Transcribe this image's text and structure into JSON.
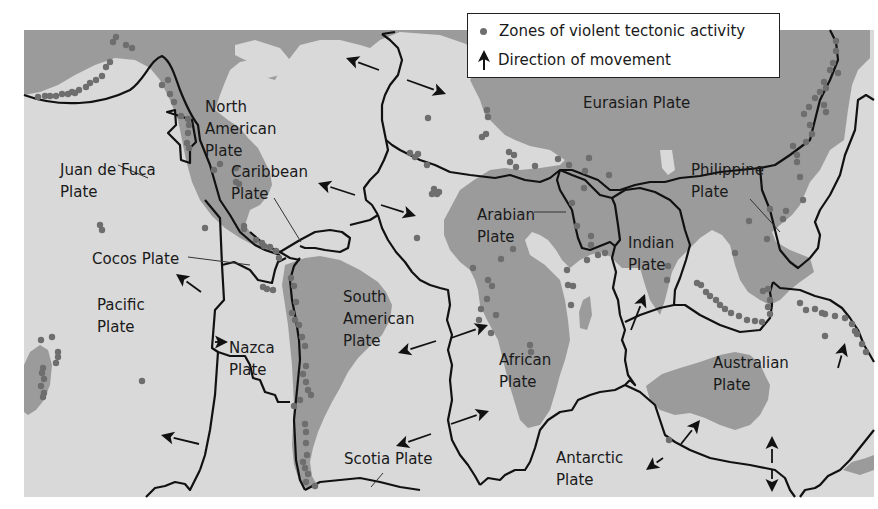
{
  "legend": {
    "dot_label": "Zones of violent tectonic activity",
    "arrow_label": "Direction of movement"
  },
  "colors": {
    "ocean": "#d9d9d9",
    "land": "#9b9b9b",
    "boundary": "#111111",
    "dot": "#6e6e6e",
    "arrow": "#111111",
    "background": "#ffffff"
  },
  "map_frame": {
    "x": 24,
    "y": 30,
    "width": 850,
    "height": 467
  },
  "plates": [
    {
      "id": "north-american",
      "lines": [
        "North",
        "American",
        "Plate"
      ],
      "x": 205,
      "y": 112
    },
    {
      "id": "eurasian",
      "lines": [
        "Eurasian Plate"
      ],
      "x": 583,
      "y": 108
    },
    {
      "id": "juan-de-fuca",
      "lines": [
        "Juan de Fuca",
        "Plate"
      ],
      "x": 60,
      "y": 175
    },
    {
      "id": "caribbean",
      "lines": [
        "Caribbean",
        "Plate"
      ],
      "x": 231,
      "y": 177
    },
    {
      "id": "philippine",
      "lines": [
        "Philippine",
        "Plate"
      ],
      "x": 691,
      "y": 175
    },
    {
      "id": "arabian",
      "lines": [
        "Arabian",
        "Plate"
      ],
      "x": 477,
      "y": 220
    },
    {
      "id": "indian",
      "lines": [
        "Indian",
        "Plate"
      ],
      "x": 628,
      "y": 248
    },
    {
      "id": "cocos",
      "lines": [
        "Cocos Plate"
      ],
      "x": 92,
      "y": 264
    },
    {
      "id": "pacific",
      "lines": [
        "Pacific",
        "Plate"
      ],
      "x": 97,
      "y": 310
    },
    {
      "id": "south-american",
      "lines": [
        "South",
        "American",
        "Plate"
      ],
      "x": 343,
      "y": 302
    },
    {
      "id": "nazca",
      "lines": [
        "Nazca",
        "Plate"
      ],
      "x": 229,
      "y": 353
    },
    {
      "id": "african",
      "lines": [
        "African",
        "Plate"
      ],
      "x": 499,
      "y": 365
    },
    {
      "id": "australian",
      "lines": [
        "Australian",
        "Plate"
      ],
      "x": 713,
      "y": 368
    },
    {
      "id": "scotia",
      "lines": [
        "Scotia Plate"
      ],
      "x": 344,
      "y": 464
    },
    {
      "id": "antarctic",
      "lines": [
        "Antarctic",
        "Plate"
      ],
      "x": 556,
      "y": 463
    }
  ],
  "leader_lines": [
    [
      [
        148,
        178
      ],
      [
        118,
        165
      ]
    ],
    [
      [
        274,
        198
      ],
      [
        301,
        242
      ]
    ],
    [
      [
        750,
        199
      ],
      [
        780,
        232
      ]
    ],
    [
      [
        534,
        212
      ],
      [
        566,
        212
      ]
    ],
    [
      [
        188,
        257
      ],
      [
        250,
        265
      ]
    ],
    [
      [
        383,
        473
      ],
      [
        371,
        487
      ]
    ]
  ],
  "arrows": [
    [
      [
        379,
        70
      ],
      [
        346,
        58
      ]
    ],
    [
      [
        407,
        80
      ],
      [
        446,
        94
      ]
    ],
    [
      [
        355,
        195
      ],
      [
        318,
        183
      ]
    ],
    [
      [
        381,
        205
      ],
      [
        416,
        216
      ]
    ],
    [
      [
        201,
        292
      ],
      [
        176,
        274
      ]
    ],
    [
      [
        222,
        342
      ],
      [
        228,
        342
      ]
    ],
    [
      [
        436,
        341
      ],
      [
        398,
        353
      ]
    ],
    [
      [
        451,
        338
      ],
      [
        488,
        325
      ]
    ],
    [
      [
        431,
        434
      ],
      [
        396,
        446
      ]
    ],
    [
      [
        451,
        424
      ],
      [
        489,
        411
      ]
    ],
    [
      [
        199,
        444
      ],
      [
        161,
        435
      ]
    ],
    [
      [
        631,
        330
      ],
      [
        645,
        294
      ]
    ],
    [
      [
        838,
        368
      ],
      [
        845,
        343
      ]
    ],
    [
      [
        681,
        444
      ],
      [
        700,
        420
      ]
    ],
    [
      [
        663,
        458
      ],
      [
        646,
        470
      ]
    ],
    [
      [
        772,
        463
      ],
      [
        772,
        436
      ]
    ],
    [
      [
        772,
        470
      ],
      [
        772,
        492
      ]
    ]
  ],
  "dots": [
    [
      116,
      37
    ],
    [
      113,
      42
    ],
    [
      126,
      45
    ],
    [
      132,
      48
    ],
    [
      110,
      62
    ],
    [
      106,
      67
    ],
    [
      102,
      76
    ],
    [
      96,
      80
    ],
    [
      90,
      83
    ],
    [
      86,
      87
    ],
    [
      79,
      90
    ],
    [
      75,
      93
    ],
    [
      72,
      92
    ],
    [
      68,
      94
    ],
    [
      62,
      94
    ],
    [
      56,
      96
    ],
    [
      50,
      96
    ],
    [
      45,
      96
    ],
    [
      38,
      97
    ],
    [
      162,
      85
    ],
    [
      168,
      80
    ],
    [
      170,
      94
    ],
    [
      174,
      102
    ],
    [
      181,
      116
    ],
    [
      188,
      119
    ],
    [
      189,
      125
    ],
    [
      188,
      133
    ],
    [
      187,
      143
    ],
    [
      189,
      148
    ],
    [
      220,
      164
    ],
    [
      214,
      170
    ],
    [
      236,
      168
    ],
    [
      236,
      182
    ],
    [
      239,
      184
    ],
    [
      205,
      228
    ],
    [
      244,
      226
    ],
    [
      244,
      229
    ],
    [
      256,
      240
    ],
    [
      262,
      243
    ],
    [
      264,
      246
    ],
    [
      270,
      247
    ],
    [
      276,
      251
    ],
    [
      279,
      258
    ],
    [
      263,
      287
    ],
    [
      267,
      289
    ],
    [
      273,
      290
    ],
    [
      291,
      278
    ],
    [
      294,
      286
    ],
    [
      296,
      302
    ],
    [
      292,
      313
    ],
    [
      295,
      320
    ],
    [
      299,
      325
    ],
    [
      302,
      337
    ],
    [
      305,
      346
    ],
    [
      300,
      400
    ],
    [
      294,
      406
    ],
    [
      306,
      366
    ],
    [
      303,
      374
    ],
    [
      306,
      382
    ],
    [
      308,
      390
    ],
    [
      311,
      395
    ],
    [
      305,
      424
    ],
    [
      306,
      432
    ],
    [
      306,
      443
    ],
    [
      307,
      455
    ],
    [
      303,
      462
    ],
    [
      305,
      468
    ],
    [
      308,
      474
    ],
    [
      306,
      482
    ],
    [
      315,
      486
    ],
    [
      41,
      340
    ],
    [
      52,
      337
    ],
    [
      58,
      352
    ],
    [
      58,
      357
    ],
    [
      56,
      363
    ],
    [
      43,
      368
    ],
    [
      42,
      373
    ],
    [
      44,
      379
    ],
    [
      41,
      386
    ],
    [
      44,
      393
    ],
    [
      43,
      397
    ],
    [
      142,
      381
    ],
    [
      100,
      225
    ],
    [
      102,
      230
    ],
    [
      428,
      118
    ],
    [
      410,
      153
    ],
    [
      418,
      154
    ],
    [
      415,
      157
    ],
    [
      427,
      165
    ],
    [
      432,
      194
    ],
    [
      437,
      194
    ],
    [
      434,
      189
    ],
    [
      439,
      192
    ],
    [
      417,
      238
    ],
    [
      487,
      110
    ],
    [
      488,
      117
    ],
    [
      486,
      134
    ],
    [
      482,
      137
    ],
    [
      509,
      152
    ],
    [
      514,
      155
    ],
    [
      510,
      162
    ],
    [
      516,
      167
    ],
    [
      535,
      166
    ],
    [
      558,
      159
    ],
    [
      569,
      165
    ],
    [
      585,
      171
    ],
    [
      589,
      158
    ],
    [
      584,
      188
    ],
    [
      609,
      175
    ],
    [
      473,
      268
    ],
    [
      488,
      280
    ],
    [
      492,
      286
    ],
    [
      487,
      299
    ],
    [
      496,
      315
    ],
    [
      481,
      309
    ],
    [
      479,
      320
    ],
    [
      491,
      333
    ],
    [
      530,
      345
    ],
    [
      531,
      352
    ],
    [
      501,
      259
    ],
    [
      513,
      249
    ],
    [
      567,
      270
    ],
    [
      571,
      305
    ],
    [
      573,
      286
    ],
    [
      568,
      285
    ],
    [
      572,
      203
    ],
    [
      577,
      226
    ],
    [
      591,
      236
    ],
    [
      591,
      245
    ],
    [
      598,
      255
    ],
    [
      587,
      260
    ],
    [
      605,
      253
    ],
    [
      668,
      266
    ],
    [
      667,
      280
    ],
    [
      735,
      253
    ],
    [
      767,
      239
    ],
    [
      749,
      221
    ],
    [
      770,
      209
    ],
    [
      786,
      211
    ],
    [
      783,
      219
    ],
    [
      803,
      200
    ],
    [
      800,
      177
    ],
    [
      797,
      162
    ],
    [
      797,
      155
    ],
    [
      793,
      146
    ],
    [
      806,
      142
    ],
    [
      812,
      134
    ],
    [
      810,
      125
    ],
    [
      804,
      114
    ],
    [
      809,
      107
    ],
    [
      815,
      98
    ],
    [
      820,
      92
    ],
    [
      826,
      88
    ],
    [
      824,
      82
    ],
    [
      830,
      70
    ],
    [
      838,
      73
    ],
    [
      833,
      63
    ],
    [
      836,
      51
    ],
    [
      836,
      41
    ],
    [
      824,
      105
    ],
    [
      826,
      112
    ],
    [
      697,
      283
    ],
    [
      701,
      285
    ],
    [
      706,
      292
    ],
    [
      710,
      296
    ],
    [
      716,
      300
    ],
    [
      720,
      305
    ],
    [
      725,
      309
    ],
    [
      731,
      313
    ],
    [
      739,
      316
    ],
    [
      747,
      320
    ],
    [
      755,
      321
    ],
    [
      762,
      322
    ],
    [
      770,
      314
    ],
    [
      768,
      307
    ],
    [
      770,
      300
    ],
    [
      763,
      291
    ],
    [
      768,
      289
    ],
    [
      800,
      303
    ],
    [
      806,
      310
    ],
    [
      815,
      309
    ],
    [
      822,
      313
    ],
    [
      825,
      314
    ],
    [
      835,
      316
    ],
    [
      845,
      318
    ],
    [
      852,
      324
    ],
    [
      857,
      334
    ],
    [
      862,
      344
    ],
    [
      866,
      352
    ],
    [
      855,
      331
    ],
    [
      825,
      336
    ],
    [
      669,
      440
    ]
  ],
  "land": [
    "M24,30 L870,30 L870,58 L858,70 L852,85 L848,110 L844,140 L830,150 L820,170 L810,182 L800,205 L792,215 L780,225 L772,232 L776,242 L790,250 L810,258 L814,272 L800,282 L790,290 L780,300 L770,305 L760,300 L748,292 L740,280 L735,265 L730,245 L722,235 L712,230 L700,238 L688,250 L678,260 L672,272 L665,300 L660,315 L650,300 L645,285 L640,268 L622,268 L611,257 L600,252 L590,255 L580,260 L570,268 L562,260 L556,250 L548,240 L540,235 L532,232 L525,240 L530,255 L545,265 L560,280 L565,300 L568,320 L570,340 L565,360 L560,375 L556,390 L550,410 L540,425 L528,428 L520,420 L514,400 L508,380 L503,360 L498,340 L487,320 L480,305 L478,290 L475,280 L470,270 L460,262 L450,250 L444,235 L444,220 L452,205 L460,190 L474,180 L490,170 L505,168 L520,170 L540,168 L560,165 L565,160 L550,150 L530,146 L515,140 L505,135 L495,125 L485,115 L480,100 L470,80 L476,70 L480,58 L466,44 L440,35 L400,32 L380,40 L370,48 L360,45 L340,40 L320,40 L300,45 L290,58 L280,70 L275,80 L268,78 L260,65 L250,60 L240,62 L230,70 L225,82 L220,95 L215,110 L228,120 L240,128 L248,138 L258,148 L264,160 L270,172 L272,185 L268,195 L260,205 L250,210 L245,225 L256,240 L270,248 L280,255 L268,252 L255,246 L240,238 L225,228 L212,216 L200,200 L192,182 L186,160 L182,140 L178,120 L170,100 L160,80 L150,68 L135,60 L115,58 L95,65 L75,75 L58,85 L40,92 L24,95 Z",
    "M285,265 L305,258 L320,256 L340,260 L360,270 L378,282 L386,292 L392,305 L390,320 L382,335 L370,346 L358,358 L348,372 L340,388 L332,402 L324,418 L318,432 L313,448 L310,462 L312,476 L318,487 L306,488 L299,480 L294,465 L292,445 L293,425 L294,405 L293,385 L292,365 L290,345 L288,325 L285,305 L282,285 Z",
    "M646,386 L662,374 L680,368 L700,362 L720,355 L735,352 L750,355 L760,364 L765,375 L770,385 L768,400 L760,415 L750,425 L735,430 L720,425 L705,418 L690,413 L675,415 L660,410 L650,400 Z",
    "M24,365 L30,352 L40,345 L48,350 L52,365 L50,385 L44,400 L36,410 L28,415 L24,412 Z",
    "M583,300 L590,296 L592,315 L587,330 L580,328 L579,312 Z",
    "M843,470 L852,462 L866,458 L874,455 L874,470 L860,475 Z"
  ],
  "ocean_islands": [
    "M235,45 L255,40 L280,48 L290,60 L280,75 L268,78 L260,68 L245,60 L235,55 Z",
    "M430,100 L448,98 L455,110 L448,120 L435,118 Z",
    "M660,150 L672,150 L675,170 L668,175 L662,168 Z",
    "M270,105 L285,105 L290,120 L278,130 L268,118 Z"
  ],
  "boundaries": [
    "M24,95 C60,108 100,105 130,90 C145,80 150,60 162,56 C172,62 176,80 180,90 C184,100 190,115 198,125 L200,140 L210,165 L220,200 L230,215 L240,232 L255,245 L265,250 L280,255",
    "M167,112 L175,110 L176,125 L168,133 L180,145 L181,160 L190,163 L190,148 L196,142 L192,120 Z",
    "M205,200 L220,218 L222,265 L234,262 L250,270 L258,280 L272,283 L275,270 L278,262 L286,258",
    "M222,265 L224,300 L215,310 L212,348 L218,352 L215,395 L210,430 L205,455 L200,470",
    "M146,497 L155,488 L165,486 L175,482 L185,484 L190,490 L200,470",
    "M218,352 L230,356 L245,356 L250,365 L253,378 L260,380 L265,392 L275,395 L278,402 L290,402",
    "M250,232 L265,245 L280,252 L290,258 L300,260",
    "M300,258 L294,266 L290,280 L292,300 L296,320 L299,340 L300,360 L298,380 L296,400 L294,420 L295,440 L296,460 L300,480 L305,490",
    "M305,490 L320,482 L340,480 L360,478 L380,482 L400,487 L420,490",
    "M280,252 L300,240 L315,232 L330,230 L342,232 L350,238 L348,248 L340,252 L325,250 L315,248 L305,248 L300,246",
    "M350,225 L370,220 L378,215",
    "M378,215 L372,205 L366,200 L364,188 L370,180 L378,172 L384,160 L388,150 L386,140 L384,130 L382,120 L382,105 L385,95 L390,85 L398,75 L402,60 L398,48 L390,40 L382,34",
    "M382,34 L395,32",
    "M378,215 L382,228 L388,240 L396,252 L405,262 L412,272 L420,280 L430,285 L440,288 L448,290 L450,305 L447,320 L452,335 L448,350 L452,365 L450,380 L452,400 L448,420 L452,440 L460,455 L468,465 L475,476 L480,485",
    "M480,485 L488,478 L500,480 L505,475 L515,470 L525,470 L530,462 L535,448 L540,430 L548,420 L560,412 L572,410 L578,400 L590,395 L600,392 L615,390 L625,385 L630,380",
    "M386,140 L392,145 L400,150 L410,155 L420,160 L435,165 L450,172 L470,175 L495,178 L510,175 L525,180 L540,182 L550,178 L560,170 L572,170 L585,175 L598,180 L610,190 L620,190 L635,185 L650,182 L665,182",
    "M560,170 L557,180 L560,190 L566,200 L572,210 L575,225 L578,238 L582,248 L590,250 L600,246 L610,242 L615,246",
    "M560,170 L572,175 L585,180 L600,195 L612,198 L615,205 L618,225 L620,240 L615,246",
    "M615,246 L612,258 L616,272 L613,288 L618,300 L620,315 L625,330 L622,340 L626,350 L625,360 L628,375 L635,385 L630,380",
    "M612,198 L625,190 L640,188 L655,192 L670,200 L680,210 L685,230 L690,245 L686,260 L680,278 L675,290 L674,305 L660,308 L640,315 L625,322",
    "M674,305 L685,305 L700,315 L720,325 L740,332 L760,330 L770,318 L772,305 L770,292 L773,282",
    "M665,182 L680,178 L700,176 L720,172 L740,170 L760,168 L775,165 L790,155 L810,140 L815,120 L820,100 L830,80 L838,60 L836,42 L830,30",
    "M760,168 L762,190 L770,210 L775,230 L780,250 L790,262 L798,268 L810,258 L818,248 L820,235 L815,222 L820,210 L830,195 L840,175 L845,155 L855,130 L858,100 L866,95 L874,100",
    "M773,282 L780,288 L800,290 L815,296 L830,300 L842,308 L850,318 L858,330 L864,345 L870,355 L874,362",
    "M625,385 L640,392 L655,405 L660,420 L665,435 L675,442 L690,450 L710,458 L730,462 L750,465 L765,468 L775,470 L785,478 L790,490 L795,497",
    "M800,497 L805,490 L815,488 L820,485 L828,476 L840,470 L850,460 L858,450 L866,440 L874,430"
  ]
}
